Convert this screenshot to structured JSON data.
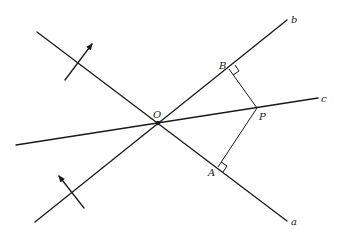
{
  "diagram": {
    "title": "",
    "points": {
      "O": {
        "label": "O",
        "x": 158,
        "y": 123
      },
      "P": {
        "label": "P",
        "x": 257,
        "y": 108
      },
      "A": {
        "label": "A",
        "x": 218,
        "y": 167
      },
      "B": {
        "label": "B",
        "x": 229,
        "y": 69
      }
    },
    "lines": {
      "a": {
        "label": "a",
        "from": [
          37,
          32
        ],
        "to": [
          287,
          221
        ]
      },
      "b": {
        "label": "b",
        "from": [
          35,
          222
        ],
        "to": [
          287,
          20
        ]
      },
      "c": {
        "label": "c",
        "from": [
          16,
          145
        ],
        "to": [
          318,
          98
        ]
      }
    },
    "perpendiculars": [
      {
        "from": "P",
        "to": "B",
        "right_angle": true
      },
      {
        "from": "P",
        "to": "A",
        "right_angle": true
      }
    ],
    "normal_arrows": [
      {
        "on_line": "a",
        "direction": "up-right"
      },
      {
        "on_line": "b",
        "direction": "up-left"
      }
    ]
  }
}
